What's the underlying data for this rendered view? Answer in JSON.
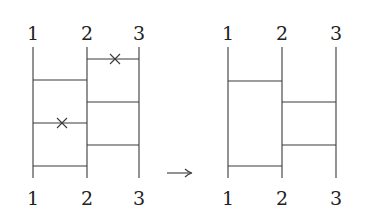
{
  "diagram": {
    "type": "ladder-diagram-transformation",
    "arrow": "→",
    "left": {
      "top_labels": [
        "1",
        "2",
        "3"
      ],
      "bottom_labels": [
        "1",
        "2",
        "3"
      ],
      "rungs": [
        {
          "between": "2-3",
          "crossed": true
        },
        {
          "between": "1-2",
          "crossed": false
        },
        {
          "between": "2-3",
          "crossed": false
        },
        {
          "between": "1-2",
          "crossed": true
        },
        {
          "between": "2-3",
          "crossed": false
        },
        {
          "between": "1-2",
          "crossed": false
        }
      ]
    },
    "right": {
      "top_labels": [
        "1",
        "2",
        "3"
      ],
      "bottom_labels": [
        "1",
        "2",
        "3"
      ],
      "rungs": [
        {
          "between": "1-2",
          "crossed": false
        },
        {
          "between": "2-3",
          "crossed": false
        },
        {
          "between": "2-3",
          "crossed": false
        },
        {
          "between": "1-2",
          "crossed": false
        }
      ]
    }
  }
}
